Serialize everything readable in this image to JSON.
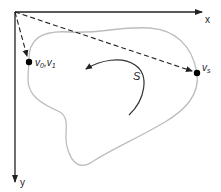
{
  "diagram": {
    "axes": {
      "x_label": "x",
      "y_label": "y"
    },
    "points": [
      {
        "id": "v01",
        "label_main": "v",
        "label_sub_a": "0",
        "label_sep": ",",
        "label_main_b": "v",
        "label_sub_b": "1"
      },
      {
        "id": "vs",
        "label_main": "v",
        "label_sub": "s"
      }
    ],
    "region_label": "S",
    "colors": {
      "axis": "#222222",
      "outline": "#b8b8b8",
      "dashed": "#222222",
      "arrow": "#333333",
      "point": "#000000"
    }
  }
}
